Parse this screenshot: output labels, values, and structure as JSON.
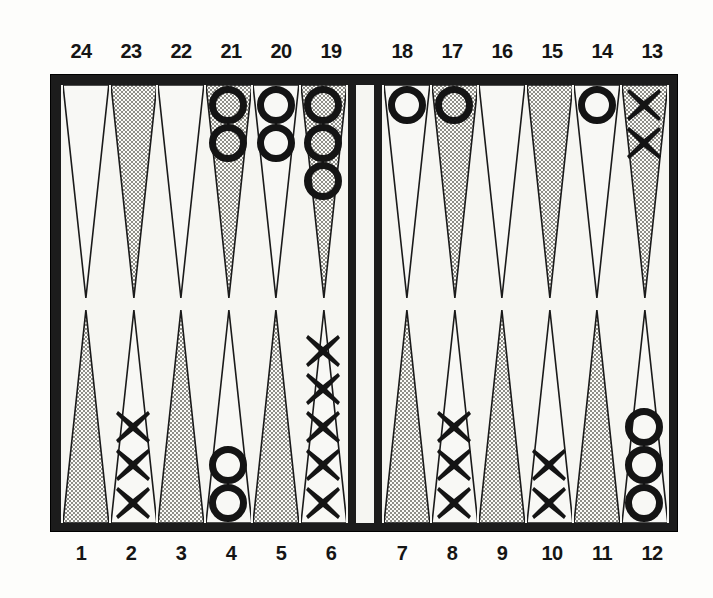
{
  "figure": {
    "board_color": "#1c1c1c",
    "surface_color": "#f6f6f2",
    "point_shaded_color": "#c9c9c4",
    "point_light_color": "#f8f8f5",
    "checker_color": "#141414"
  },
  "labels": {
    "top_left": [
      "24",
      "23",
      "22",
      "21",
      "20",
      "19"
    ],
    "top_right": [
      "18",
      "17",
      "16",
      "15",
      "14",
      "13"
    ],
    "bottom_left": [
      "1",
      "2",
      "3",
      "4",
      "5",
      "6"
    ],
    "bottom_right": [
      "7",
      "8",
      "9",
      "10",
      "11",
      "12"
    ]
  },
  "chart_data": {
    "type": "table",
    "xlabel": "Point number",
    "ylabel": "Checkers on point",
    "legend": [
      "O = open circle checker",
      "X = cross checker"
    ],
    "categories": [
      "1",
      "2",
      "3",
      "4",
      "5",
      "6",
      "7",
      "8",
      "9",
      "10",
      "11",
      "12",
      "13",
      "14",
      "15",
      "16",
      "17",
      "18",
      "19",
      "20",
      "21",
      "22",
      "23",
      "24"
    ],
    "series": [
      {
        "name": "O",
        "values": [
          0,
          0,
          0,
          2,
          0,
          0,
          0,
          0,
          0,
          0,
          0,
          3,
          0,
          1,
          0,
          0,
          1,
          1,
          3,
          2,
          2,
          0,
          0,
          0
        ]
      },
      {
        "name": "X",
        "values": [
          0,
          3,
          0,
          0,
          0,
          5,
          0,
          3,
          0,
          2,
          0,
          0,
          2,
          0,
          0,
          0,
          0,
          0,
          0,
          0,
          0,
          0,
          0,
          0
        ]
      }
    ],
    "points": [
      {
        "number": "24",
        "quadrant": "top-left",
        "shaded": false,
        "checker": null,
        "count": 0
      },
      {
        "number": "23",
        "quadrant": "top-left",
        "shaded": true,
        "checker": null,
        "count": 0
      },
      {
        "number": "22",
        "quadrant": "top-left",
        "shaded": false,
        "checker": null,
        "count": 0
      },
      {
        "number": "21",
        "quadrant": "top-left",
        "shaded": true,
        "checker": "O",
        "count": 2
      },
      {
        "number": "20",
        "quadrant": "top-left",
        "shaded": false,
        "checker": "O",
        "count": 2
      },
      {
        "number": "19",
        "quadrant": "top-left",
        "shaded": true,
        "checker": "O",
        "count": 3
      },
      {
        "number": "18",
        "quadrant": "top-right",
        "shaded": false,
        "checker": "O",
        "count": 1
      },
      {
        "number": "17",
        "quadrant": "top-right",
        "shaded": true,
        "checker": "O",
        "count": 1
      },
      {
        "number": "16",
        "quadrant": "top-right",
        "shaded": false,
        "checker": null,
        "count": 0
      },
      {
        "number": "15",
        "quadrant": "top-right",
        "shaded": true,
        "checker": null,
        "count": 0
      },
      {
        "number": "14",
        "quadrant": "top-right",
        "shaded": false,
        "checker": "O",
        "count": 1
      },
      {
        "number": "13",
        "quadrant": "top-right",
        "shaded": true,
        "checker": "X",
        "count": 2
      },
      {
        "number": "1",
        "quadrant": "bottom-left",
        "shaded": true,
        "checker": null,
        "count": 0
      },
      {
        "number": "2",
        "quadrant": "bottom-left",
        "shaded": false,
        "checker": "X",
        "count": 3
      },
      {
        "number": "3",
        "quadrant": "bottom-left",
        "shaded": true,
        "checker": null,
        "count": 0
      },
      {
        "number": "4",
        "quadrant": "bottom-left",
        "shaded": false,
        "checker": "O",
        "count": 2
      },
      {
        "number": "5",
        "quadrant": "bottom-left",
        "shaded": true,
        "checker": null,
        "count": 0
      },
      {
        "number": "6",
        "quadrant": "bottom-left",
        "shaded": false,
        "checker": "X",
        "count": 5
      },
      {
        "number": "7",
        "quadrant": "bottom-right",
        "shaded": true,
        "checker": null,
        "count": 0
      },
      {
        "number": "8",
        "quadrant": "bottom-right",
        "shaded": false,
        "checker": "X",
        "count": 3
      },
      {
        "number": "9",
        "quadrant": "bottom-right",
        "shaded": true,
        "checker": null,
        "count": 0
      },
      {
        "number": "10",
        "quadrant": "bottom-right",
        "shaded": false,
        "checker": "X",
        "count": 2
      },
      {
        "number": "11",
        "quadrant": "bottom-right",
        "shaded": true,
        "checker": null,
        "count": 0
      },
      {
        "number": "12",
        "quadrant": "bottom-right",
        "shaded": false,
        "checker": "O",
        "count": 3
      }
    ]
  }
}
